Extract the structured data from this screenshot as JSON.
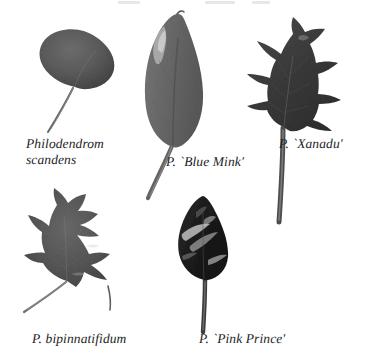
{
  "plate": {
    "title": "Philodendron leaf comparison plate",
    "background_color": "#ffffff",
    "text_color": "#1d1d1d",
    "width": 372,
    "height": 354
  },
  "specimens": [
    {
      "id": "scandens",
      "caption": "Philodendrom\nscandens",
      "leaf_shape": "heart-shaped",
      "tone": "#5d5d5d",
      "position": "top-left"
    },
    {
      "id": "blue-mink",
      "caption": "P. `Blue Mink'",
      "leaf_shape": "elongated oval with pointed tip",
      "tone": "#6b6b6b",
      "position": "top-center"
    },
    {
      "id": "xanadu",
      "caption": "P. `Xanadu'",
      "leaf_shape": "pinnately lobed",
      "tone": "#3a3a3a",
      "position": "top-right"
    },
    {
      "id": "bipinnatifidum",
      "caption": "P. bipinnatifidum",
      "leaf_shape": "deeply cut lobed",
      "tone": "#5a5a5a",
      "position": "bottom-left"
    },
    {
      "id": "pink-prince",
      "caption": "P. `Pink Prince'",
      "leaf_shape": "arrowhead, variegated",
      "tone": "#1e1e1e",
      "position": "bottom-center"
    }
  ]
}
